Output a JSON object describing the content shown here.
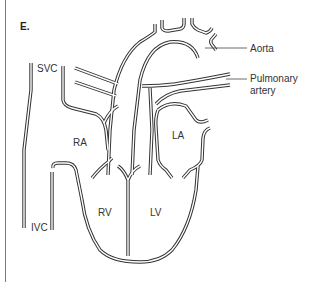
{
  "figure": {
    "panel_label": "E.",
    "labels": {
      "svc": "SVC",
      "ivc": "IVC",
      "ra": "RA",
      "la": "LA",
      "rv": "RV",
      "lv": "LV",
      "aorta": "Aorta",
      "pulmonary_line1": "Pulmonary",
      "pulmonary_line2": "artery"
    },
    "colors": {
      "line": "#333333",
      "background": "#ffffff"
    }
  }
}
